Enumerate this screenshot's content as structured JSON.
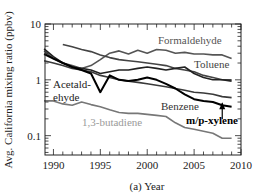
{
  "chart_data": {
    "type": "line",
    "title": "",
    "xlabel": "(a) Year",
    "ylabel": "Avg. California mixing ratio (ppbv)",
    "yscale": "log",
    "xlim": [
      1989.1,
      2010
    ],
    "ylim": [
      0.045,
      10
    ],
    "x_ticks": [
      1990,
      1995,
      2000,
      2005,
      2010
    ],
    "x_tick_labels": [
      "1990",
      "1995",
      "2000",
      "2005",
      "2010"
    ],
    "y_ticks": [
      0.1,
      1,
      10
    ],
    "y_tick_labels": [
      "0.1",
      "1",
      "10"
    ],
    "grid": false,
    "legend": "inline-labels",
    "series": [
      {
        "name": "Formaldehyde",
        "color": "#555555",
        "x": [
          1989,
          1990,
          1991,
          1992,
          1993,
          1994,
          1995,
          1996,
          1997,
          1998,
          1999,
          2000,
          2001,
          2002,
          2003,
          2004,
          2005,
          2006,
          2007,
          2008,
          2009
        ],
        "values": [
          3.3,
          2.4,
          2.0,
          1.8,
          1.6,
          1.8,
          2.3,
          3.0,
          3.3,
          2.9,
          3.4,
          3.0,
          3.5,
          3.4,
          3.0,
          3.1,
          2.9,
          2.9,
          2.8,
          2.8,
          2.4
        ]
      },
      {
        "name": "Toluene",
        "color": "#444444",
        "x": [
          1991,
          1992,
          1993,
          1994,
          1995,
          1996,
          1997,
          1998,
          1999,
          2000,
          2001,
          2002,
          2003,
          2004,
          2005,
          2006,
          2007,
          2008,
          2009
        ],
        "values": [
          4.3,
          3.9,
          3.5,
          3.2,
          2.8,
          2.5,
          2.3,
          2.2,
          2.1,
          2.0,
          1.9,
          1.8,
          1.6,
          1.5,
          1.4,
          1.2,
          1.1,
          1.0,
          1.0
        ]
      },
      {
        "name": "Acetaldehyde",
        "color": "#222222",
        "x": [
          1989,
          1990,
          1991,
          1992,
          1993,
          1994,
          1995,
          1996,
          1997,
          1998,
          1999,
          2000,
          2001,
          2002,
          2003,
          2004,
          2005,
          2006,
          2007,
          2008,
          2009
        ],
        "values": [
          3.6,
          2.6,
          2.0,
          1.7,
          1.6,
          1.5,
          1.3,
          1.4,
          1.5,
          1.5,
          1.6,
          1.7,
          1.6,
          1.5,
          1.6,
          1.7,
          1.3,
          1.1,
          1.0,
          1.0,
          0.95
        ]
      },
      {
        "name": "Benzene",
        "color": "#3a3a3a",
        "x": [
          1989,
          1990,
          1991,
          1992,
          1993,
          1994,
          1995,
          1996,
          1997,
          1998,
          1999,
          2000,
          2001,
          2002,
          2003,
          2004,
          2005,
          2006,
          2007,
          2008,
          2009
        ],
        "values": [
          2.2,
          2.0,
          1.8,
          1.6,
          1.5,
          1.4,
          1.2,
          1.1,
          1.0,
          0.95,
          0.9,
          0.85,
          0.8,
          0.75,
          0.7,
          0.65,
          0.6,
          0.58,
          0.55,
          0.5,
          0.48
        ]
      },
      {
        "name": "m/p-xylene",
        "color": "#000000",
        "x": [
          1989,
          1990,
          1991,
          1992,
          1993,
          1994,
          1995,
          1996,
          1997,
          1998,
          1999,
          2000,
          2001,
          2002,
          2003,
          2004,
          2005,
          2006,
          2007,
          2008,
          2009
        ],
        "values": [
          2.9,
          2.4,
          2.0,
          1.7,
          1.5,
          1.3,
          0.6,
          1.2,
          1.0,
          0.95,
          1.0,
          1.1,
          1.0,
          0.85,
          0.7,
          0.55,
          0.45,
          0.42,
          0.4,
          0.35,
          0.33
        ]
      },
      {
        "name": "1,3-butadiene",
        "color": "#777777",
        "x": [
          1989,
          1990,
          1991,
          1992,
          1993,
          1994,
          1995,
          1996,
          1997,
          1998,
          1999,
          2000,
          2001,
          2002,
          2003,
          2004,
          2005,
          2006,
          2007,
          2008,
          2009
        ],
        "values": [
          0.42,
          0.42,
          0.37,
          0.35,
          0.4,
          0.36,
          0.33,
          0.29,
          0.26,
          0.25,
          0.25,
          0.24,
          0.23,
          0.22,
          0.17,
          0.14,
          0.13,
          0.12,
          0.11,
          0.09,
          0.09
        ]
      }
    ],
    "annotations": [
      {
        "text": "Formaldehyde",
        "series": "Formaldehyde",
        "color": "#555555"
      },
      {
        "text": "Toluene",
        "series": "Toluene",
        "color": "#444444"
      },
      {
        "text": "Acetald-",
        "series": "Acetaldehyde",
        "color": "#222222"
      },
      {
        "text": "ehyde",
        "series": "Acetaldehyde",
        "color": "#222222"
      },
      {
        "text": "Benzene",
        "series": "Benzene",
        "color": "#333333"
      },
      {
        "text": "m/p-xylene",
        "series": "m/p-xylene",
        "color": "#000000",
        "arrow": true,
        "arrow_year": 2008
      },
      {
        "text": "1,3-butadiene",
        "series": "1,3-butadiene",
        "color": "#999999"
      }
    ]
  }
}
